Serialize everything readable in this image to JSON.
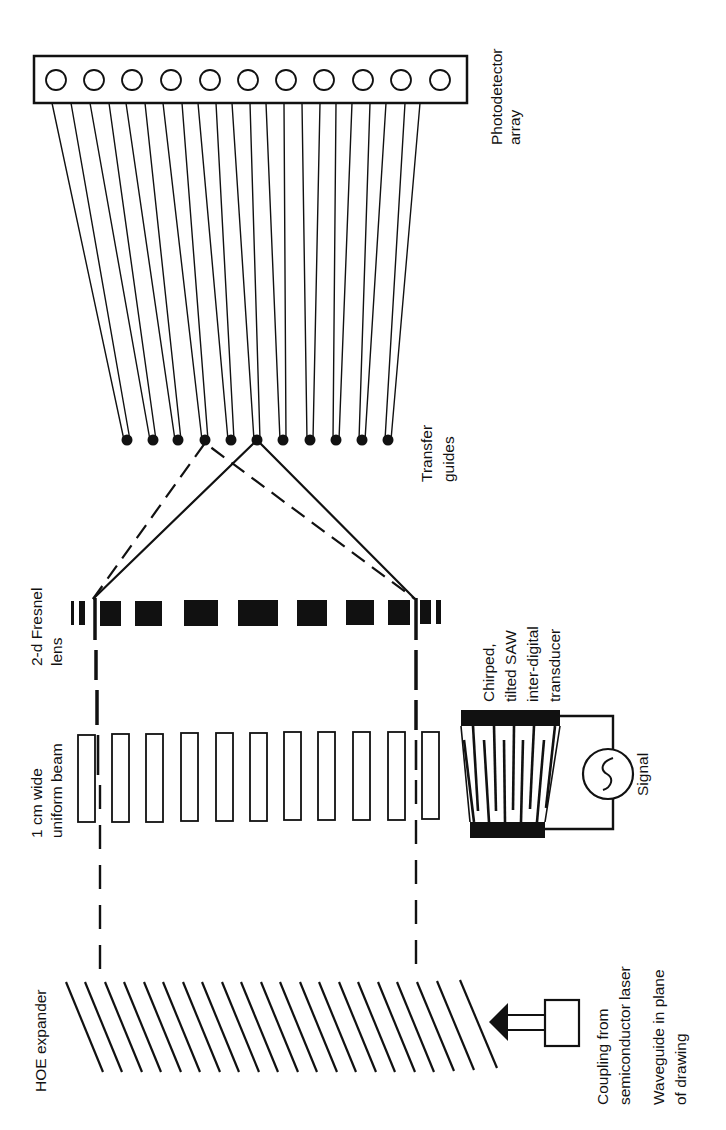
{
  "diagram": {
    "orientation": "rotated-90-ccw",
    "colors": {
      "ink": "#111111",
      "background": "#ffffff"
    },
    "labels": {
      "photodetector": {
        "line1": "Photodetector",
        "line2": "array"
      },
      "transfer_guides": {
        "line1": "Transfer",
        "line2": "guides"
      },
      "fresnel_lens": {
        "line1": "2-d Fresnel",
        "line2": "lens"
      },
      "uniform_beam": {
        "line1": "1 cm wide",
        "line2": "uniform beam"
      },
      "hoe_expander": {
        "line1": "HOE expander"
      },
      "transducer": {
        "line1": "Chirped,",
        "line2": "tilted SAW",
        "line3": "inter-digital",
        "line4": "transducer"
      },
      "signal": {
        "line1": "Signal"
      },
      "coupling": {
        "line1": "Coupling from",
        "line2": "semiconductor laser"
      },
      "waveguide": {
        "line1": "Waveguide in plane",
        "line2": "of drawing"
      }
    },
    "components": {
      "photodetector_count": 12,
      "transfer_guide_count": 11,
      "saw_beam_segments": 11,
      "hoe_grating_lines": 21,
      "fresnel_zones": 11
    }
  }
}
